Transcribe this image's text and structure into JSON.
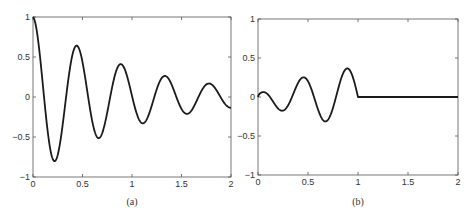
{
  "chart_data": [
    {
      "panel": "(a)",
      "type": "line",
      "title": "",
      "caption": "(a)",
      "xlabel": "",
      "ylabel": "",
      "xlim": [
        0,
        2
      ],
      "ylim": [
        -1,
        1
      ],
      "xticks": [
        0,
        0.5,
        1,
        1.5,
        2
      ],
      "xticklabels": [
        "0",
        "0.5",
        "1",
        "1.5",
        "2"
      ],
      "yticks": [
        -1,
        -0.5,
        0,
        0.5,
        1
      ],
      "yticklabels": [
        "−1",
        "−0.5",
        "0",
        "0.5",
        "1"
      ],
      "grid": false,
      "legend": null,
      "description": "Damped oscillation starting at 1, approx e^(-t)·cos(14.1t)",
      "key_points": {
        "x": [
          0,
          0.22,
          0.45,
          0.67,
          0.89,
          1.11,
          1.33,
          1.56,
          1.78,
          2.0
        ],
        "y": [
          1.0,
          -0.8,
          0.63,
          -0.51,
          0.4,
          -0.33,
          0.25,
          -0.21,
          0.16,
          -0.15
        ]
      },
      "model": {
        "kind": "damped_cos",
        "decay": 1.0,
        "omega": 14.1
      }
    },
    {
      "panel": "(b)",
      "type": "line",
      "title": "",
      "caption": "(b)",
      "xlabel": "",
      "ylabel": "",
      "xlim": [
        0,
        2
      ],
      "ylim": [
        -1,
        1
      ],
      "xticks": [
        0,
        0.5,
        1,
        1.5,
        2
      ],
      "xticklabels": [
        "0",
        "0.5",
        "1",
        "1.5",
        "2"
      ],
      "yticks": [
        -1,
        -0.5,
        0,
        0.5,
        1
      ],
      "yticklabels": [
        "−1",
        "−0.5",
        "0",
        "0.5",
        "1"
      ],
      "grid": false,
      "legend": null,
      "description": "Growing oscillation on [0,1], zero on (1,2]",
      "key_points": {
        "x": [
          0,
          0.05,
          0.24,
          0.46,
          0.68,
          0.9,
          1.0,
          1.5,
          2.0
        ],
        "y": [
          0.0,
          0.04,
          -0.18,
          0.28,
          -0.35,
          0.37,
          0.0,
          0.0,
          0.0
        ]
      },
      "model": {
        "kind": "windowed_growing_sin",
        "amp": 0.39,
        "power": 0.55,
        "omega": 14.28,
        "cutoff": 1.0
      }
    }
  ],
  "style": {
    "line_color": "#1a1a1a",
    "axis_color": "#555555",
    "background": "#ffffff"
  }
}
